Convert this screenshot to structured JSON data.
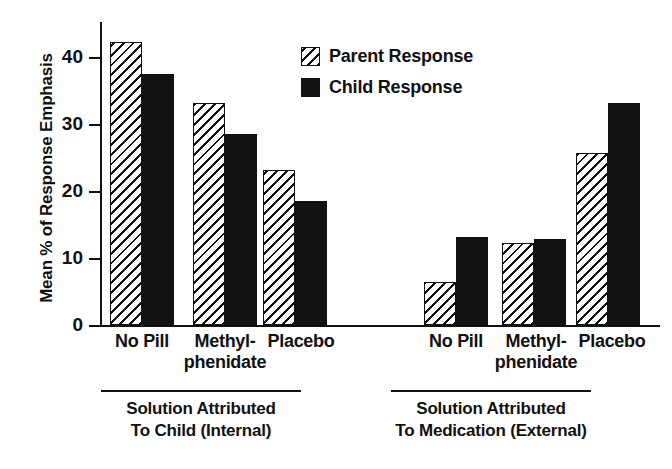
{
  "chart_data": {
    "type": "bar",
    "title": "",
    "xlabel": "",
    "ylabel": "Mean % of Response Emphasis",
    "ylim": [
      0,
      45
    ],
    "yticks": [
      0,
      10,
      20,
      30,
      40
    ],
    "ytick_labels": [
      "0",
      "10",
      "20",
      "30",
      "40"
    ],
    "grid": false,
    "legend_position": "upper center",
    "categories": [
      "No Pill",
      "Methyl-phenidate",
      "Placebo"
    ],
    "panels": [
      {
        "name": "internal",
        "caption_line1": "Solution Attributed",
        "caption_line2": "To Child (Internal)",
        "categories": [
          "No Pill",
          "Methyl-phenidate",
          "Placebo"
        ],
        "series": [
          {
            "name": "Parent Response",
            "values": [
              42.3,
              33.1,
              23.2
            ]
          },
          {
            "name": "Child Response",
            "values": [
              37.4,
              28.5,
              18.5
            ]
          }
        ]
      },
      {
        "name": "external",
        "caption_line1": "Solution Attributed",
        "caption_line2": "To Medication (External)",
        "categories": [
          "No Pill",
          "Methyl-phenidate",
          "Placebo"
        ],
        "series": [
          {
            "name": "Parent Response",
            "values": [
              6.4,
              12.2,
              25.6
            ]
          },
          {
            "name": "Child Response",
            "values": [
              13.1,
              12.9,
              33.2
            ]
          }
        ]
      }
    ],
    "legend": [
      {
        "label": "Parent Response",
        "fill": "hatched",
        "color": "#111111"
      },
      {
        "label": "Child Response",
        "fill": "solid",
        "color": "#111111"
      }
    ]
  },
  "axis": {
    "y_label": "Mean % of Response Emphasis",
    "tick_0": "0",
    "tick_10": "10",
    "tick_20": "20",
    "tick_30": "30",
    "tick_40": "40"
  },
  "legend": {
    "parent_label": "Parent Response",
    "child_label": "Child Response"
  },
  "categories": {
    "left_no_pill": "No Pill",
    "left_methyl_1": "Methyl-",
    "left_methyl_2": "phenidate",
    "left_placebo": "Placebo",
    "right_no_pill": "No Pill",
    "right_methyl_1": "Methyl-",
    "right_methyl_2": "phenidate",
    "right_placebo": "Placebo"
  },
  "panel_captions": {
    "left_line1": "Solution Attributed",
    "left_line2": "To Child (Internal)",
    "right_line1": "Solution Attributed",
    "right_line2": "To Medication (External)"
  }
}
